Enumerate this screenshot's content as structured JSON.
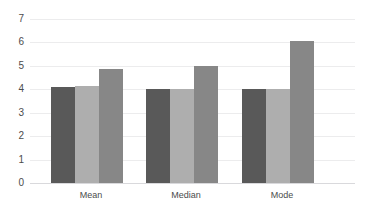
{
  "chart_data": {
    "type": "bar",
    "title": "",
    "xlabel": "",
    "ylabel": "",
    "categories": [
      "Mean",
      "Median",
      "Mode"
    ],
    "series": [
      {
        "name": "Series 1",
        "color": "#595959",
        "values": [
          4.1,
          4.0,
          4.0
        ]
      },
      {
        "name": "Series 2",
        "color": "#aeaeae",
        "values": [
          4.12,
          4.0,
          4.0
        ]
      },
      {
        "name": "Series 3",
        "color": "#878787",
        "values": [
          4.88,
          5.0,
          6.05
        ]
      }
    ],
    "ylim": [
      0,
      7
    ],
    "ytick_labels": [
      "0",
      "1",
      "2",
      "3",
      "4",
      "5",
      "6",
      "7"
    ],
    "ytick_values": [
      0,
      1,
      2,
      3,
      4,
      5,
      6,
      7
    ],
    "grid": true,
    "legend": "none",
    "gridline_color": "#ececed",
    "baseline_color": "#d9d9dc",
    "tick_label_color": "#4c4c4c",
    "background": "#ffffff"
  },
  "axis": {
    "y_tick_0": "0",
    "y_tick_1": "1",
    "y_tick_2": "2",
    "y_tick_3": "3",
    "y_tick_4": "4",
    "y_tick_5": "5",
    "y_tick_6": "6",
    "y_tick_7": "7"
  },
  "categories": {
    "cat_0": "Mean",
    "cat_1": "Median",
    "cat_2": "Mode"
  }
}
